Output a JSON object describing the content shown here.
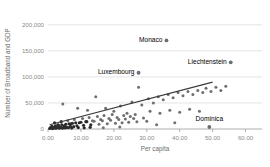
{
  "chart_data": {
    "type": "scatter",
    "title": "",
    "xlabel": "Per capita",
    "ylabel": "Number of Broadband and GDP",
    "xlim": [
      0,
      65
    ],
    "ylim": [
      0,
      215000
    ],
    "grid": true,
    "legend": null,
    "xticks": [
      "0.00",
      "10.00",
      "20.00",
      "30.00",
      "40.00",
      "50.00",
      "60.00"
    ],
    "xtick_values": [
      0,
      10,
      20,
      30,
      40,
      50,
      60
    ],
    "yticks": [
      "0",
      "50,000",
      "100,000",
      "150,000",
      "200,000"
    ],
    "ytick_values": [
      0,
      50000,
      100000,
      150000,
      200000
    ],
    "annotations": [
      {
        "label": "Monaco",
        "x": 36.0,
        "y": 170000
      },
      {
        "label": "Liechtenstein",
        "x": 55.5,
        "y": 128000
      },
      {
        "label": "Luxembourg",
        "x": 27.5,
        "y": 108000
      },
      {
        "label": "Dominica",
        "x": 49.0,
        "y": 4000
      }
    ],
    "trendline": {
      "x0": 0.5,
      "y0": 8000,
      "x1": 50.0,
      "y1": 90000
    },
    "points": [
      {
        "x": 36.0,
        "y": 170000
      },
      {
        "x": 55.5,
        "y": 128000
      },
      {
        "x": 27.5,
        "y": 108000
      },
      {
        "x": 27.5,
        "y": 80000
      },
      {
        "x": 49.0,
        "y": 4000
      },
      {
        "x": 4.5,
        "y": 48000
      },
      {
        "x": 9.0,
        "y": 40000
      },
      {
        "x": 12.0,
        "y": 36000
      },
      {
        "x": 14.5,
        "y": 62000
      },
      {
        "x": 17.5,
        "y": 40000
      },
      {
        "x": 20.0,
        "y": 34000
      },
      {
        "x": 22.0,
        "y": 44000
      },
      {
        "x": 24.0,
        "y": 30000
      },
      {
        "x": 25.5,
        "y": 52000
      },
      {
        "x": 28.5,
        "y": 46000
      },
      {
        "x": 30.5,
        "y": 58000
      },
      {
        "x": 32.0,
        "y": 50000
      },
      {
        "x": 33.5,
        "y": 62000
      },
      {
        "x": 35.0,
        "y": 56000
      },
      {
        "x": 36.5,
        "y": 66000
      },
      {
        "x": 38.0,
        "y": 60000
      },
      {
        "x": 39.5,
        "y": 70000
      },
      {
        "x": 41.0,
        "y": 64000
      },
      {
        "x": 42.5,
        "y": 72000
      },
      {
        "x": 44.0,
        "y": 66000
      },
      {
        "x": 45.5,
        "y": 74000
      },
      {
        "x": 47.0,
        "y": 70000
      },
      {
        "x": 48.0,
        "y": 78000
      },
      {
        "x": 49.5,
        "y": 72000
      },
      {
        "x": 51.0,
        "y": 80000
      },
      {
        "x": 52.5,
        "y": 74000
      },
      {
        "x": 54.0,
        "y": 82000
      },
      {
        "x": 31.0,
        "y": 34000
      },
      {
        "x": 34.0,
        "y": 30000
      },
      {
        "x": 37.0,
        "y": 36000
      },
      {
        "x": 40.0,
        "y": 32000
      },
      {
        "x": 43.0,
        "y": 38000
      },
      {
        "x": 46.0,
        "y": 34000
      },
      {
        "x": 2.0,
        "y": 12000
      },
      {
        "x": 3.0,
        "y": 8000
      },
      {
        "x": 4.0,
        "y": 14000
      },
      {
        "x": 5.0,
        "y": 6000
      },
      {
        "x": 6.0,
        "y": 16000
      },
      {
        "x": 7.0,
        "y": 10000
      },
      {
        "x": 8.0,
        "y": 18000
      },
      {
        "x": 9.5,
        "y": 12000
      },
      {
        "x": 10.5,
        "y": 20000
      },
      {
        "x": 11.5,
        "y": 14000
      },
      {
        "x": 12.5,
        "y": 22000
      },
      {
        "x": 13.5,
        "y": 16000
      },
      {
        "x": 15.0,
        "y": 24000
      },
      {
        "x": 16.0,
        "y": 18000
      },
      {
        "x": 17.0,
        "y": 26000
      },
      {
        "x": 18.5,
        "y": 20000
      },
      {
        "x": 19.5,
        "y": 28000
      },
      {
        "x": 21.0,
        "y": 22000
      },
      {
        "x": 23.0,
        "y": 26000
      },
      {
        "x": 25.0,
        "y": 24000
      },
      {
        "x": 26.5,
        "y": 28000
      },
      {
        "x": 0.8,
        "y": 3000
      },
      {
        "x": 1.2,
        "y": 5000
      },
      {
        "x": 1.6,
        "y": 2000
      },
      {
        "x": 2.2,
        "y": 6000
      },
      {
        "x": 2.6,
        "y": 3500
      },
      {
        "x": 3.2,
        "y": 7000
      },
      {
        "x": 3.6,
        "y": 2500
      },
      {
        "x": 4.2,
        "y": 8000
      },
      {
        "x": 4.8,
        "y": 4000
      },
      {
        "x": 5.4,
        "y": 9000
      },
      {
        "x": 5.8,
        "y": 3000
      },
      {
        "x": 6.4,
        "y": 10000
      },
      {
        "x": 6.8,
        "y": 5000
      },
      {
        "x": 7.4,
        "y": 11000
      },
      {
        "x": 7.8,
        "y": 4500
      },
      {
        "x": 8.4,
        "y": 12000
      },
      {
        "x": 8.8,
        "y": 6000
      },
      {
        "x": 10.0,
        "y": 13000
      },
      {
        "x": 10.8,
        "y": 7000
      },
      {
        "x": 11.8,
        "y": 14000
      },
      {
        "x": 13.0,
        "y": 8000
      },
      {
        "x": 14.0,
        "y": 15000
      },
      {
        "x": 15.5,
        "y": 9000
      },
      {
        "x": 16.5,
        "y": 16000
      },
      {
        "x": 18.0,
        "y": 10000
      },
      {
        "x": 19.0,
        "y": 17000
      },
      {
        "x": 20.5,
        "y": 11000
      },
      {
        "x": 21.5,
        "y": 18000
      },
      {
        "x": 22.5,
        "y": 12000
      },
      {
        "x": 23.5,
        "y": 19000
      },
      {
        "x": 24.5,
        "y": 13000
      },
      {
        "x": 26.0,
        "y": 20000
      },
      {
        "x": 27.0,
        "y": 14000
      },
      {
        "x": 29.0,
        "y": 21000
      },
      {
        "x": 30.0,
        "y": 15000
      },
      {
        "x": 0.5,
        "y": 1000
      },
      {
        "x": 1.0,
        "y": 1500
      },
      {
        "x": 1.4,
        "y": 900
      },
      {
        "x": 1.8,
        "y": 2200
      },
      {
        "x": 2.4,
        "y": 1200
      },
      {
        "x": 2.8,
        "y": 2600
      },
      {
        "x": 3.4,
        "y": 1400
      },
      {
        "x": 3.8,
        "y": 3000
      },
      {
        "x": 4.4,
        "y": 1600
      },
      {
        "x": 5.2,
        "y": 2000
      },
      {
        "x": 6.2,
        "y": 2400
      },
      {
        "x": 7.2,
        "y": 1800
      },
      {
        "x": 9.2,
        "y": 2800
      },
      {
        "x": 11.0,
        "y": 2200
      },
      {
        "x": 12.8,
        "y": 3200
      },
      {
        "x": 16.8,
        "y": 2600
      },
      {
        "x": 21.8,
        "y": 4000
      },
      {
        "x": 38.5,
        "y": 12000
      },
      {
        "x": 33.0,
        "y": 8000
      }
    ]
  }
}
